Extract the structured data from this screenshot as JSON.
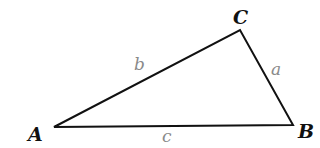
{
  "diagram": {
    "type": "triangle",
    "vertices": [
      {
        "id": "A",
        "label": "A",
        "x": 54,
        "y": 127,
        "label_x": 28,
        "label_y": 141
      },
      {
        "id": "B",
        "label": "B",
        "x": 293,
        "y": 125,
        "label_x": 298,
        "label_y": 138
      },
      {
        "id": "C",
        "label": "C",
        "x": 240,
        "y": 30,
        "label_x": 233,
        "label_y": 24
      }
    ],
    "sides": [
      {
        "id": "a",
        "label": "a",
        "from": "B",
        "to": "C",
        "label_x": 271,
        "label_y": 75
      },
      {
        "id": "b",
        "label": "b",
        "from": "A",
        "to": "C",
        "label_x": 134,
        "label_y": 70
      },
      {
        "id": "c",
        "label": "c",
        "from": "A",
        "to": "B",
        "label_x": 162,
        "label_y": 142
      }
    ],
    "colors": {
      "stroke": "#111111",
      "vertex_label": "#111111",
      "side_label": "#8a8a8a"
    }
  }
}
